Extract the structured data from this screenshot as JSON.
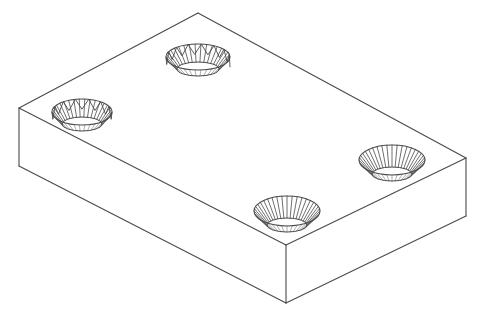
{
  "drawing": {
    "title": "Isometric rectangular plate with four countersunk holes",
    "type": "technical-line-drawing",
    "background_color": "#ffffff",
    "line_color": "#4a4a4a",
    "face_fill": "#ffffff",
    "canvas": {
      "width": 487,
      "height": 322
    }
  },
  "solid": {
    "name": "rectangular-plate",
    "top_face": {
      "label": "top-face",
      "vertices": [
        {
          "name": "rear",
          "x": 198,
          "y": 13
        },
        {
          "name": "right",
          "x": 466,
          "y": 158
        },
        {
          "name": "front",
          "x": 286,
          "y": 245
        },
        {
          "name": "left",
          "x": 19,
          "y": 108
        }
      ]
    },
    "thickness_px": 58,
    "front_left_face": {
      "label": "front-left-face",
      "vertices": [
        {
          "x": 19,
          "y": 108
        },
        {
          "x": 286,
          "y": 245
        },
        {
          "x": 286,
          "y": 303
        },
        {
          "x": 19,
          "y": 166
        }
      ]
    },
    "front_right_face": {
      "label": "front-right-face",
      "vertices": [
        {
          "x": 286,
          "y": 245
        },
        {
          "x": 466,
          "y": 158
        },
        {
          "x": 466,
          "y": 216
        },
        {
          "x": 286,
          "y": 303
        }
      ]
    },
    "edges": [
      {
        "name": "top-rear-left-edge",
        "x1": 198,
        "y1": 13,
        "x2": 19,
        "y2": 108
      },
      {
        "name": "top-rear-right-edge",
        "x1": 198,
        "y1": 13,
        "x2": 466,
        "y2": 158
      },
      {
        "name": "top-front-left-edge",
        "x1": 19,
        "y1": 108,
        "x2": 286,
        "y2": 245
      },
      {
        "name": "top-front-right-edge",
        "x1": 286,
        "y1": 245,
        "x2": 466,
        "y2": 158
      },
      {
        "name": "left-vertical-edge",
        "x1": 19,
        "y1": 108,
        "x2": 19,
        "y2": 166
      },
      {
        "name": "front-vertical-edge",
        "x1": 286,
        "y1": 245,
        "x2": 286,
        "y2": 303
      },
      {
        "name": "right-vertical-edge",
        "x1": 466,
        "y1": 158,
        "x2": 466,
        "y2": 216
      },
      {
        "name": "bottom-front-left-edge",
        "x1": 19,
        "y1": 166,
        "x2": 286,
        "y2": 303
      },
      {
        "name": "bottom-front-right-edge",
        "x1": 286,
        "y1": 303,
        "x2": 466,
        "y2": 216
      }
    ]
  },
  "holes": [
    {
      "id": "hole-rear",
      "label": "countersunk-hole-rear",
      "center_x": 198,
      "center_y": 57,
      "rx": 32,
      "ry": 13,
      "depth_px": 12,
      "inner_rx": 21,
      "inner_ry": 7,
      "style": "threaded-zigzag",
      "ray_count": 34,
      "zigzag_count": 15
    },
    {
      "id": "hole-left",
      "label": "countersunk-hole-left",
      "center_x": 82,
      "center_y": 112,
      "rx": 30,
      "ry": 13,
      "depth_px": 12,
      "inner_rx": 20,
      "inner_ry": 7,
      "style": "threaded-zigzag",
      "ray_count": 34,
      "zigzag_count": 14
    },
    {
      "id": "hole-right",
      "label": "countersunk-hole-right",
      "center_x": 392,
      "center_y": 160,
      "rx": 33,
      "ry": 15,
      "depth_px": 14,
      "inner_rx": 20,
      "inner_ry": 7,
      "style": "conical-radial",
      "ray_count": 40,
      "zigzag_count": 0
    },
    {
      "id": "hole-front",
      "label": "countersunk-hole-front",
      "center_x": 287,
      "center_y": 211,
      "rx": 33,
      "ry": 15,
      "depth_px": 14,
      "inner_rx": 20,
      "inner_ry": 7,
      "style": "conical-radial",
      "ray_count": 40,
      "zigzag_count": 0
    }
  ]
}
